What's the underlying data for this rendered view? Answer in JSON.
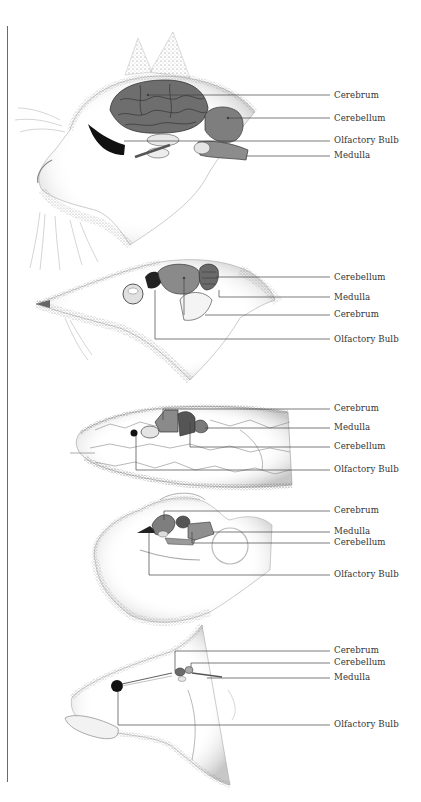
{
  "figure": {
    "type": "comparative brain anatomy illustration",
    "panels": [
      {
        "animal": "cat",
        "labels": [
          {
            "text": "Cerebrum",
            "y": 96
          },
          {
            "text": "Cerebellum",
            "y": 119
          },
          {
            "text": "Olfactory Bulb",
            "y": 141
          },
          {
            "text": "Medulla",
            "y": 156
          }
        ]
      },
      {
        "animal": "shrew",
        "labels": [
          {
            "text": "Cerebellum",
            "y": 278
          },
          {
            "text": "Medulla",
            "y": 298
          },
          {
            "text": "Cerebrum",
            "y": 315
          },
          {
            "text": "Olfactory Bulb",
            "y": 340
          }
        ]
      },
      {
        "animal": "snake",
        "labels": [
          {
            "text": "Cerebrum",
            "y": 408
          },
          {
            "text": "Medulla",
            "y": 427
          },
          {
            "text": "Cerebellum",
            "y": 446
          },
          {
            "text": "Olfactory Bulb",
            "y": 470
          }
        ]
      },
      {
        "animal": "frog",
        "labels": [
          {
            "text": "Cerebrum",
            "y": 511
          },
          {
            "text": "Medulla",
            "y": 532
          },
          {
            "text": "Cerebellum",
            "y": 543
          },
          {
            "text": "Olfactory Bulb",
            "y": 575
          }
        ]
      },
      {
        "animal": "fish",
        "labels": [
          {
            "text": "Cerebrum",
            "y": 651
          },
          {
            "text": "Cerebellum",
            "y": 663
          },
          {
            "text": "Medulla",
            "y": 677
          },
          {
            "text": "Olfactory Bulb",
            "y": 725
          }
        ]
      }
    ]
  },
  "colors": {
    "ink": "#333333",
    "stipple": "#8a8a8a",
    "brain_dark": "#5a5a5a",
    "brain_mid": "#8c8c8c",
    "olfactory": "#111111"
  }
}
